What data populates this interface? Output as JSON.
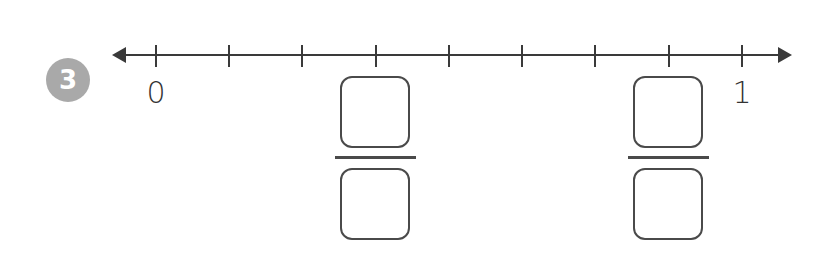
{
  "problem": {
    "number": "3",
    "badge_color": "#a9a9a9"
  },
  "number_line": {
    "start_label": "0",
    "end_label": "1",
    "divisions": 8,
    "tick_count": 9,
    "line_color": "#3a3a3a",
    "tick_positions_px": [
      156,
      229,
      302,
      376,
      449,
      522,
      595,
      669,
      742
    ]
  },
  "answer_blanks": [
    {
      "tick_index": 3,
      "numerator": "",
      "denominator": ""
    },
    {
      "tick_index": 7,
      "numerator": "",
      "denominator": ""
    }
  ]
}
